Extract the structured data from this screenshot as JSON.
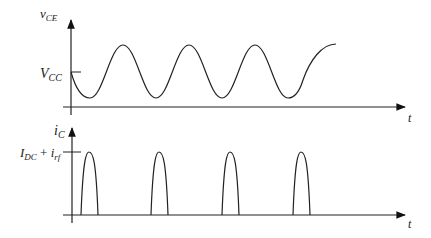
{
  "top_plot": {
    "y_label": "v",
    "y_label_sub": "CE",
    "level_label": "V",
    "level_label_sub": "CC",
    "x_label": "t"
  },
  "bottom_plot": {
    "y_label": "i",
    "y_label_sub": "C",
    "level_label_a": "I",
    "level_label_a_sub": "DC",
    "level_label_plus": " + ",
    "level_label_b": "i",
    "level_label_b_sub": "rf",
    "x_label": "t"
  },
  "colors": {
    "stroke": "#222222",
    "background": "#ffffff"
  }
}
